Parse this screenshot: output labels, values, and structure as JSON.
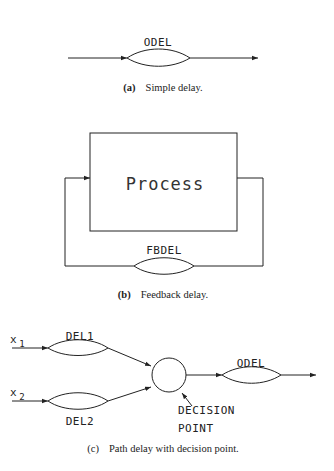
{
  "panel_a": {
    "delay_label": "ODEL",
    "caption_letter": "(a)",
    "caption_text": "Simple delay."
  },
  "panel_b": {
    "process_label": "Process",
    "delay_label": "FBDEL",
    "caption_letter": "(b)",
    "caption_text": "Feedback delay."
  },
  "panel_c": {
    "input1_label": "x",
    "input1_sub": "1",
    "input2_label": "x",
    "input2_sub": "2",
    "delay1_label": "DEL1",
    "delay2_label": "DEL2",
    "output_delay_label": "ODEL",
    "decision_label_line1": "DECISION",
    "decision_label_line2": "POINT",
    "caption_letter": "(c)",
    "caption_text": "Path delay with decision point."
  }
}
